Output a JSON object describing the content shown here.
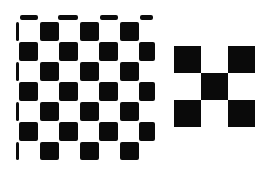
{
  "figure": {
    "colors": {
      "dark": "#0a0a0a",
      "light": "#ffffff"
    }
  },
  "left_board": {
    "origin": [
      19,
      15
    ],
    "cell": 20,
    "rows": 8,
    "cols": 7
  },
  "right_board": {
    "origin": [
      174,
      46
    ],
    "cell": 27,
    "pattern": [
      [
        1,
        0,
        1
      ],
      [
        0,
        1,
        0
      ],
      [
        1,
        0,
        1
      ]
    ]
  }
}
